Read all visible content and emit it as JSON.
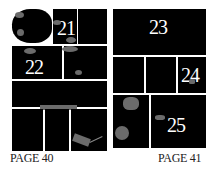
{
  "pages": [
    {
      "caption": "PAGE 40",
      "panels": [
        {
          "id": "p40-1",
          "number": ""
        },
        {
          "id": "p40-2",
          "number": "21"
        },
        {
          "id": "p40-3",
          "number": ""
        },
        {
          "id": "p40-4",
          "number": "22"
        },
        {
          "id": "p40-5",
          "number": ""
        },
        {
          "id": "p40-6",
          "number": ""
        },
        {
          "id": "p40-7",
          "number": ""
        },
        {
          "id": "p40-8",
          "number": ""
        },
        {
          "id": "p40-9",
          "number": ""
        }
      ]
    },
    {
      "caption": "PAGE 41",
      "panels": [
        {
          "id": "p41-1",
          "number": "23"
        },
        {
          "id": "p41-2",
          "number": ""
        },
        {
          "id": "p41-3",
          "number": ""
        },
        {
          "id": "p41-4",
          "number": "24"
        },
        {
          "id": "p41-5",
          "number": ""
        },
        {
          "id": "p41-6",
          "number": "25"
        }
      ]
    }
  ],
  "colors": {
    "panel": "#000000",
    "gutter": "#ffffff",
    "blob": "#6b6b6b",
    "text": "#ffffff"
  }
}
